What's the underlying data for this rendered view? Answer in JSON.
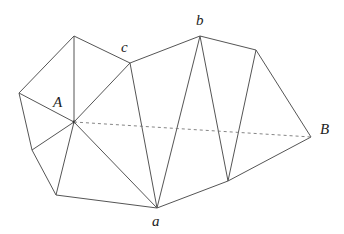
{
  "diagram": {
    "labels": {
      "A": "A",
      "B": "B",
      "a": "a",
      "b": "b",
      "c": "c"
    },
    "vertices": [
      "top",
      "c",
      "b",
      "right_top",
      "B",
      "bottom_right",
      "a",
      "bottom_left",
      "lower_left",
      "left",
      "A"
    ],
    "edges": [
      [
        "top",
        "left"
      ],
      [
        "top",
        "c"
      ],
      [
        "top",
        "A"
      ],
      [
        "c",
        "A"
      ],
      [
        "c",
        "a"
      ],
      [
        "c",
        "b"
      ],
      [
        "b",
        "a"
      ],
      [
        "b",
        "right_top"
      ],
      [
        "b",
        "bottom_right"
      ],
      [
        "right_top",
        "bottom_right"
      ],
      [
        "right_top",
        "B"
      ],
      [
        "bottom_right",
        "B"
      ],
      [
        "a",
        "bottom_right"
      ],
      [
        "left",
        "A"
      ],
      [
        "left",
        "lower_left"
      ],
      [
        "lower_left",
        "A"
      ],
      [
        "lower_left",
        "bottom_left"
      ],
      [
        "bottom_left",
        "A"
      ],
      [
        "bottom_left",
        "a"
      ],
      [
        "A",
        "a"
      ]
    ],
    "dashed_edges": [
      [
        "A",
        "B"
      ]
    ]
  }
}
